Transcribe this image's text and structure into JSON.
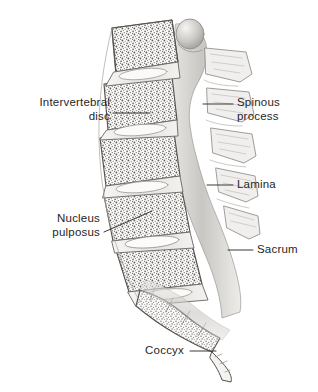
{
  "figure": {
    "view": "lateral sagittal section",
    "style": "grayscale medical illustration, stippled trabecular bone",
    "background_color": "#ffffff",
    "ink_color": "#262626",
    "bone_fill": "#f2f1ef",
    "bone_line": "#8d8b88",
    "shade_gray": "#b9b7b4",
    "stipple_color": "#6f6d6a"
  },
  "labels": [
    {
      "id": "intervertebral-disc",
      "text": "Intervertebral\ndisc",
      "align": "right",
      "x": 18,
      "y": 96,
      "width": 92,
      "leader": {
        "x1": 113,
        "y1": 113,
        "x2": 150,
        "y2": 113
      }
    },
    {
      "id": "spinous-process",
      "text": "Spinous\nprocess",
      "align": "left",
      "x": 237,
      "y": 96,
      "width": 74,
      "leader": {
        "x1": 203,
        "y1": 104,
        "x2": 233,
        "y2": 104
      }
    },
    {
      "id": "lamina",
      "text": "Lamina",
      "align": "left",
      "x": 237,
      "y": 178,
      "width": 74,
      "leader": {
        "x1": 207,
        "y1": 185,
        "x2": 233,
        "y2": 185
      }
    },
    {
      "id": "nucleus-pulposus",
      "text": "Nucleus\npulposus",
      "align": "right",
      "x": 22,
      "y": 212,
      "width": 78,
      "leader": {
        "x1": 104,
        "y1": 232,
        "x2": 152,
        "y2": 211
      }
    },
    {
      "id": "sacrum",
      "text": "Sacrum",
      "align": "left",
      "x": 257,
      "y": 243,
      "width": 58,
      "leader": {
        "x1": 228,
        "y1": 250,
        "x2": 253,
        "y2": 250
      }
    },
    {
      "id": "coccyx",
      "text": "Coccyx",
      "align": "right",
      "x": 128,
      "y": 344,
      "width": 56,
      "leader": {
        "x1": 190,
        "y1": 351,
        "x2": 216,
        "y2": 351
      }
    }
  ],
  "structures": {
    "vertebral_bodies": 5,
    "intervertebral_discs": 5,
    "sacral_segments": 5,
    "coccygeal_segments": 3
  }
}
